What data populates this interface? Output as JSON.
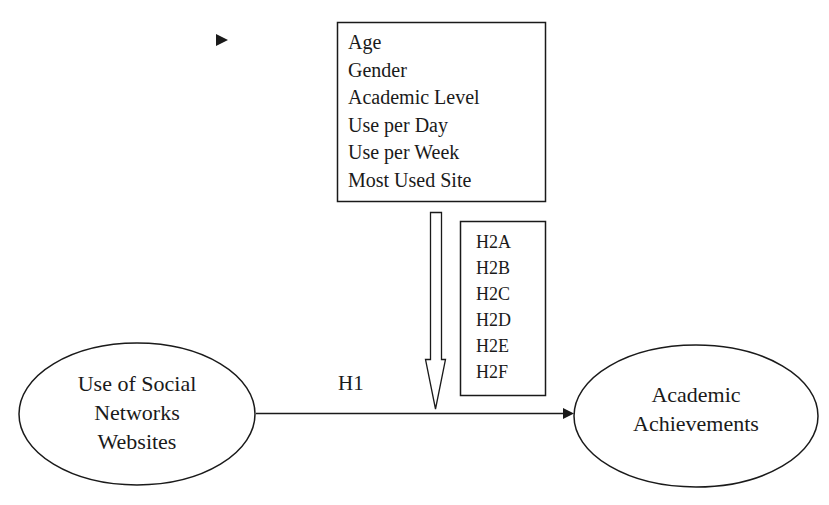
{
  "diagram": {
    "type": "conceptual-model",
    "independent_variable": {
      "label_lines": [
        "Use of Social",
        "Networks",
        "Websites"
      ]
    },
    "dependent_variable": {
      "label_lines": [
        "Academic",
        "Achievements"
      ]
    },
    "main_relation": {
      "label": "H1",
      "from": "Use of Social Networks Websites",
      "to": "Academic Achievements"
    },
    "moderators": {
      "items": [
        "Age",
        "Gender",
        "Academic Level",
        "Use per Day",
        "Use per Week",
        "Most Used Site"
      ]
    },
    "moderation_hypotheses": {
      "items": [
        "H2A",
        "H2B",
        "H2C",
        "H2D",
        "H2E",
        "H2F"
      ]
    },
    "colors": {
      "stroke": "#1a1a1a",
      "background": "#ffffff"
    }
  }
}
